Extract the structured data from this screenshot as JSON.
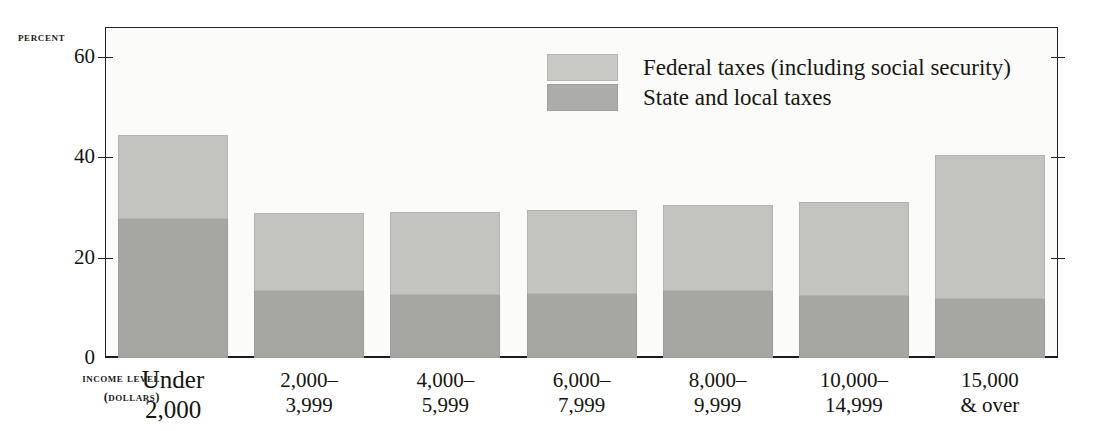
{
  "chart_data": {
    "type": "bar",
    "subtype": "stacked-vertical",
    "title": "",
    "ylabel": "PERCENT",
    "xlabel": "INCOME LEVEL (DOLLARS)",
    "xlabel_line1": "INCOME LEVEL",
    "xlabel_line2": "(DOLLARS)",
    "categories": [
      "Under 2,000",
      "2,000–3,999",
      "4,000–5,999",
      "6,000–7,999",
      "8,000–9,999",
      "10,000–14,999",
      "15,000 & over"
    ],
    "category_lines": [
      [
        "Under",
        "2,000"
      ],
      [
        "2,000–",
        "3,999"
      ],
      [
        "4,000–",
        "5,999"
      ],
      [
        "6,000–",
        "7,999"
      ],
      [
        "8,000–",
        "9,999"
      ],
      [
        "10,000–",
        "14,999"
      ],
      [
        "15,000",
        "& over"
      ]
    ],
    "series": [
      {
        "name": "State and local taxes",
        "color": "#a6a6a3",
        "values": [
          27.7,
          13.4,
          12.6,
          12.8,
          13.4,
          12.4,
          11.7
        ]
      },
      {
        "name": "Federal taxes (including social security)",
        "color": "#c3c3c0",
        "values": [
          16.8,
          15.6,
          16.6,
          16.7,
          17.1,
          18.8,
          28.8
        ]
      }
    ],
    "totals": [
      44.5,
      29.0,
      29.2,
      29.5,
      30.5,
      31.2,
      40.5
    ],
    "stack_order": [
      "State and local taxes",
      "Federal taxes (including social security)"
    ],
    "ylim": [
      0,
      66
    ],
    "ytick_values": [
      0,
      20,
      40,
      60
    ],
    "ytick_labels": [
      "0",
      "20",
      "40",
      "60"
    ],
    "grid": false,
    "legend_position": "top-right-inside",
    "legend": [
      {
        "label": "Federal taxes (including social security)",
        "color": "#c3c3c0",
        "swatch": "federal"
      },
      {
        "label": "State and local taxes",
        "color": "#a6a6a3",
        "swatch": "state"
      }
    ]
  }
}
